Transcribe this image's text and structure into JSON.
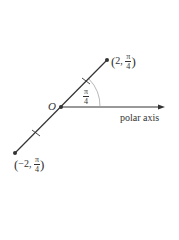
{
  "diagram": {
    "type": "polar-coordinates",
    "origin_label": "O",
    "axis_label": "polar axis",
    "angle_label": {
      "numerator": "π",
      "denominator": "4"
    },
    "points": [
      {
        "name": "positive",
        "r": "2",
        "theta_num": "π",
        "theta_den": "4"
      },
      {
        "name": "negative",
        "r": "−2",
        "theta_num": "π",
        "theta_den": "4"
      }
    ],
    "colors": {
      "line": "#333333",
      "arc": "#888888",
      "background": "#ffffff"
    }
  }
}
